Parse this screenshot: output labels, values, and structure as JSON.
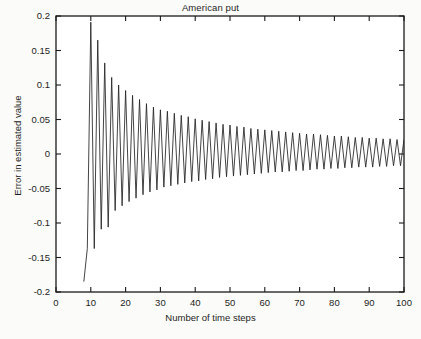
{
  "chart_data": {
    "type": "line",
    "title": "American put",
    "xlabel": "Number of time steps",
    "ylabel": "Error in estimated value",
    "xlim": [
      0,
      100
    ],
    "ylim": [
      -0.2,
      0.2
    ],
    "xticks": [
      0,
      10,
      20,
      30,
      40,
      50,
      60,
      70,
      80,
      90,
      100
    ],
    "xticklabels": [
      "0",
      "10",
      "20",
      "30",
      "40",
      "50",
      "60",
      "70",
      "80",
      "90",
      "100"
    ],
    "yticks": [
      -0.2,
      -0.15,
      -0.1,
      -0.05,
      0,
      0.05,
      0.1,
      0.15,
      0.2
    ],
    "yticklabels": [
      "-0.2",
      "-0.15",
      "-0.1",
      "-0.05",
      "0",
      "0.05",
      "0.1",
      "0.15",
      "0.2"
    ],
    "grid": false,
    "legend": null,
    "line_color": "#222222",
    "series": [
      {
        "name": "Error in estimated value",
        "x": [
          8,
          9,
          10,
          11,
          12,
          13,
          14,
          15,
          16,
          17,
          18,
          19,
          20,
          21,
          22,
          23,
          24,
          25,
          26,
          27,
          28,
          29,
          30,
          31,
          32,
          33,
          34,
          35,
          36,
          37,
          38,
          39,
          40,
          41,
          42,
          43,
          44,
          45,
          46,
          47,
          48,
          49,
          50,
          51,
          52,
          53,
          54,
          55,
          56,
          57,
          58,
          59,
          60,
          61,
          62,
          63,
          64,
          65,
          66,
          67,
          68,
          69,
          70,
          71,
          72,
          73,
          74,
          75,
          76,
          77,
          78,
          79,
          80,
          81,
          82,
          83,
          84,
          85,
          86,
          87,
          88,
          89,
          90,
          91,
          92,
          93,
          94,
          95,
          96,
          97,
          98,
          99,
          100
        ],
        "values": [
          -0.185,
          -0.137,
          0.191,
          -0.137,
          0.165,
          -0.109,
          0.132,
          -0.106,
          0.111,
          -0.082,
          0.1,
          -0.075,
          0.092,
          -0.069,
          0.085,
          -0.064,
          0.079,
          -0.059,
          0.073,
          -0.055,
          0.068,
          -0.052,
          0.064,
          -0.048,
          0.062,
          -0.046,
          0.059,
          -0.044,
          0.056,
          -0.042,
          0.054,
          -0.04,
          0.051,
          -0.039,
          0.049,
          -0.037,
          0.047,
          -0.036,
          0.045,
          -0.034,
          0.043,
          -0.033,
          0.042,
          -0.032,
          0.04,
          -0.031,
          0.039,
          -0.03,
          0.037,
          -0.029,
          0.036,
          -0.028,
          0.035,
          -0.027,
          0.034,
          -0.026,
          0.033,
          -0.026,
          0.032,
          -0.025,
          0.031,
          -0.024,
          0.03,
          -0.024,
          0.029,
          -0.023,
          0.029,
          -0.022,
          0.028,
          -0.022,
          0.027,
          -0.021,
          0.026,
          -0.021,
          0.026,
          -0.02,
          0.025,
          -0.02,
          0.024,
          -0.019,
          0.024,
          -0.019,
          0.023,
          -0.019,
          0.023,
          -0.018,
          0.022,
          -0.018,
          0.022,
          -0.017,
          0.021,
          -0.017,
          0.021
        ]
      }
    ]
  },
  "axes": {
    "tick_direction": "in",
    "box": true
  }
}
